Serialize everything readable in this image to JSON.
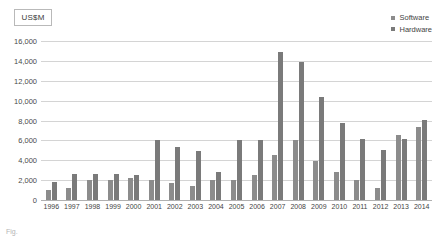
{
  "unit_badge": {
    "label": "US$M"
  },
  "legend": {
    "position": "top-right",
    "items": [
      {
        "label": "Software",
        "color": "#8c8c8c",
        "icon": "square-marker-icon"
      },
      {
        "label": "Hardware",
        "color": "#7a7a7a",
        "icon": "square-marker-icon"
      }
    ]
  },
  "caption": {
    "text": "Fig."
  },
  "chart_data": {
    "type": "bar",
    "title": "",
    "subtitle": "",
    "xlabel": "",
    "ylabel": "US$M",
    "ylim": [
      0,
      16000
    ],
    "ytick_step": 2000,
    "ytick_labels": [
      "16,000",
      "14,000",
      "12,000",
      "10,000",
      "8,000",
      "6,000",
      "4,000",
      "2,000",
      "0"
    ],
    "ytick_values": [
      16000,
      14000,
      12000,
      10000,
      8000,
      6000,
      4000,
      2000,
      0
    ],
    "grid": true,
    "legend_position": "top-right",
    "categories": [
      "1996",
      "1997",
      "1998",
      "1999",
      "2000",
      "2001",
      "2002",
      "2003",
      "2004",
      "2005",
      "2006",
      "2007",
      "2008",
      "2009",
      "2010",
      "2011",
      "2012",
      "2013",
      "2014"
    ],
    "series": [
      {
        "name": "Software",
        "color": "#8c8c8c",
        "values": [
          1000,
          1200,
          2000,
          2000,
          2200,
          2000,
          1700,
          1400,
          2000,
          2000,
          2500,
          4500,
          6000,
          3900,
          2800,
          2000,
          1200,
          6500,
          7300
        ]
      },
      {
        "name": "Hardware",
        "color": "#7a7a7a",
        "values": [
          1800,
          2600,
          2600,
          2600,
          2500,
          6000,
          5300,
          4900,
          2800,
          6000,
          6000,
          14900,
          13900,
          10400,
          7800,
          6100,
          5000,
          6100,
          8100
        ]
      }
    ]
  },
  "colors": {
    "gridline": "#d4d4d4",
    "axis": "#b0b0b0",
    "tick_text": "#4a4a4a",
    "background": "#ffffff"
  }
}
